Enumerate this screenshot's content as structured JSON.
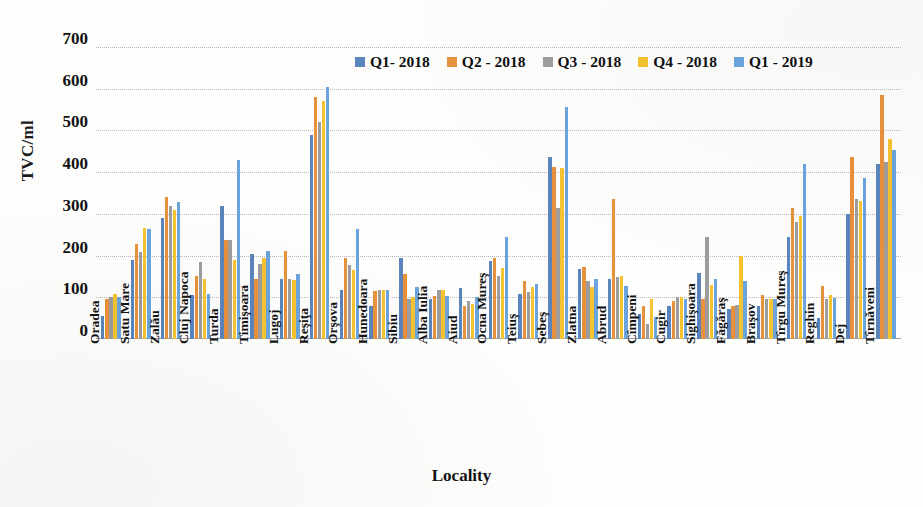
{
  "chart_data": {
    "type": "bar",
    "title": "",
    "xlabel": "Locality",
    "ylabel": "TVC/ml",
    "ylim": [
      0,
      700
    ],
    "yticks": [
      0,
      100,
      200,
      300,
      400,
      500,
      600,
      700
    ],
    "grid": true,
    "legend_position": "top-center",
    "colors": {
      "q1_2018": "#5b84bd",
      "q2_2018": "#e8913c",
      "q3_2018": "#9d9d9d",
      "q4_2018": "#f5c330",
      "q1_2019": "#6ba4dd"
    },
    "categories": [
      "Oradea",
      "Satu Mare",
      "Zalău",
      "Cluj Napoca",
      "Turda",
      "Timişoara",
      "Lugoj",
      "Reşiţa",
      "Orşova",
      "Hunedoara",
      "Sibiu",
      "Alba Iulia",
      "Aiud",
      "Ocna Mureş",
      "Teiuş",
      "Sebeş",
      "Zlatna",
      "Abrud",
      "Cîmpeni",
      "Cugir",
      "Sighişoara",
      "Făgăraş",
      "Braşov",
      "Tîrgu Mureş",
      "Reghin",
      "Dej",
      "Tîrnăveni"
    ],
    "series": [
      {
        "name": "Q1- 2018",
        "color": "#5b84bd",
        "values": [
          55,
          190,
          290,
          105,
          318,
          205,
          145,
          490,
          118,
          80,
          195,
          97,
          122,
          188,
          108,
          437,
          168,
          145,
          60,
          80,
          158,
          73,
          80,
          245,
          50,
          300,
          420
        ]
      },
      {
        "name": "Q2 - 2018",
        "color": "#e8913c",
        "values": [
          95,
          228,
          340,
          150,
          237,
          145,
          212,
          580,
          195,
          115,
          155,
          103,
          80,
          195,
          140,
          413,
          172,
          335,
          80,
          90,
          95,
          80,
          105,
          315,
          128,
          437,
          585
        ]
      },
      {
        "name": "Q3 - 2018",
        "color": "#9d9d9d",
        "values": [
          100,
          208,
          320,
          185,
          237,
          180,
          145,
          520,
          178,
          118,
          97,
          118,
          90,
          152,
          113,
          315,
          140,
          148,
          35,
          100,
          245,
          82,
          95,
          280,
          95,
          335,
          425
        ]
      },
      {
        "name": "Q4 - 2018",
        "color": "#f5c330",
        "values": [
          108,
          265,
          310,
          145,
          190,
          195,
          142,
          570,
          165,
          118,
          100,
          118,
          85,
          170,
          125,
          410,
          125,
          150,
          95,
          100,
          130,
          198,
          95,
          295,
          105,
          330,
          480
        ]
      },
      {
        "name": "Q1 - 2019",
        "color": "#6ba4dd",
        "values": [
          100,
          263,
          328,
          108,
          430,
          212,
          155,
          605,
          263,
          118,
          125,
          103,
          100,
          245,
          133,
          557,
          143,
          128,
          52,
          95,
          143,
          140,
          95,
          420,
          98,
          385,
          453
        ]
      }
    ]
  }
}
